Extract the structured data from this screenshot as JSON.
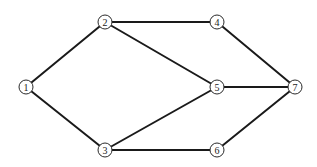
{
  "diagram": {
    "type": "undirected-graph",
    "colors": {
      "edge": "#1a1a1a",
      "node_stroke": "#2a2a2a",
      "node_fill": "#ffffff",
      "background": "#ffffff"
    },
    "nodes": [
      {
        "id": "1",
        "label": "1",
        "x": 26,
        "y": 87
      },
      {
        "id": "2",
        "label": "2",
        "x": 105,
        "y": 22
      },
      {
        "id": "3",
        "label": "3",
        "x": 105,
        "y": 150
      },
      {
        "id": "4",
        "label": "4",
        "x": 217,
        "y": 22
      },
      {
        "id": "5",
        "label": "5",
        "x": 217,
        "y": 87
      },
      {
        "id": "6",
        "label": "6",
        "x": 217,
        "y": 150
      },
      {
        "id": "7",
        "label": "7",
        "x": 295,
        "y": 87
      }
    ],
    "edges": [
      {
        "from": "1",
        "to": "2"
      },
      {
        "from": "1",
        "to": "3"
      },
      {
        "from": "2",
        "to": "4"
      },
      {
        "from": "2",
        "to": "5"
      },
      {
        "from": "3",
        "to": "5"
      },
      {
        "from": "3",
        "to": "6"
      },
      {
        "from": "4",
        "to": "7"
      },
      {
        "from": "5",
        "to": "7"
      },
      {
        "from": "6",
        "to": "7"
      }
    ]
  }
}
